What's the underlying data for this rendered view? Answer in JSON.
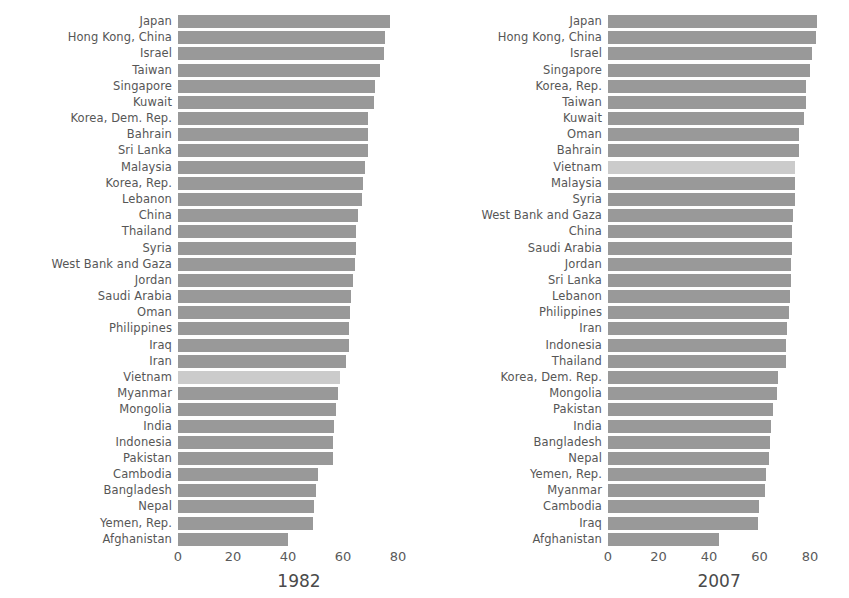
{
  "figure": {
    "background": "#ffffff",
    "bar_color": "#999999",
    "highlight_color": "#cbcbcb",
    "highlight_country": "Vietnam"
  },
  "chart_data": [
    {
      "type": "bar",
      "orientation": "horizontal",
      "title": "1982",
      "xlabel": "",
      "ylabel": "",
      "xlim": [
        0,
        88
      ],
      "xticks": [
        0,
        20,
        40,
        60,
        80
      ],
      "xtick_labels": [
        "0",
        "20",
        "40",
        "60",
        "80"
      ],
      "grid": false,
      "sorted": "descending",
      "highlight": [
        "Vietnam"
      ],
      "categories": [
        "Japan",
        "Hong Kong, China",
        "Israel",
        "Taiwan",
        "Singapore",
        "Kuwait",
        "Korea, Dem. Rep.",
        "Bahrain",
        "Sri Lanka",
        "Malaysia",
        "Korea, Rep.",
        "Lebanon",
        "China",
        "Thailand",
        "Syria",
        "West Bank and Gaza",
        "Jordan",
        "Saudi Arabia",
        "Oman",
        "Philippines",
        "Iraq",
        "Iran",
        "Vietnam",
        "Myanmar",
        "Mongolia",
        "India",
        "Indonesia",
        "Pakistan",
        "Cambodia",
        "Bangladesh",
        "Nepal",
        "Yemen, Rep.",
        "Afghanistan"
      ],
      "values": [
        77.1,
        75.4,
        75.0,
        73.4,
        71.8,
        71.3,
        69.1,
        69.1,
        69.0,
        68.0,
        67.1,
        66.9,
        65.5,
        64.6,
        64.6,
        64.4,
        63.7,
        63.0,
        62.7,
        62.1,
        62.0,
        61.0,
        58.8,
        58.1,
        57.5,
        56.6,
        56.2,
        56.2,
        50.9,
        50.0,
        49.6,
        49.1,
        39.9
      ]
    },
    {
      "type": "bar",
      "orientation": "horizontal",
      "title": "2007",
      "xlabel": "",
      "ylabel": "",
      "xlim": [
        0,
        88
      ],
      "xticks": [
        0,
        20,
        40,
        60,
        80
      ],
      "xtick_labels": [
        "0",
        "20",
        "40",
        "60",
        "80"
      ],
      "grid": false,
      "sorted": "descending",
      "highlight": [
        "Vietnam"
      ],
      "categories": [
        "Japan",
        "Hong Kong, China",
        "Israel",
        "Singapore",
        "Korea, Rep.",
        "Taiwan",
        "Kuwait",
        "Oman",
        "Bahrain",
        "Vietnam",
        "Malaysia",
        "Syria",
        "West Bank and Gaza",
        "China",
        "Saudi Arabia",
        "Jordan",
        "Sri Lanka",
        "Lebanon",
        "Philippines",
        "Iran",
        "Indonesia",
        "Thailand",
        "Korea, Dem. Rep.",
        "Mongolia",
        "Pakistan",
        "India",
        "Bangladesh",
        "Nepal",
        "Yemen, Rep.",
        "Myanmar",
        "Cambodia",
        "Iraq",
        "Afghanistan"
      ],
      "values": [
        82.6,
        82.2,
        80.7,
        80.0,
        78.6,
        78.4,
        77.6,
        75.6,
        75.6,
        74.2,
        74.2,
        74.1,
        73.4,
        73.0,
        72.8,
        72.5,
        72.4,
        71.9,
        71.7,
        71.0,
        70.6,
        70.6,
        67.3,
        66.8,
        65.5,
        64.7,
        64.1,
        63.8,
        62.7,
        62.1,
        59.7,
        59.5,
        43.8
      ]
    }
  ]
}
